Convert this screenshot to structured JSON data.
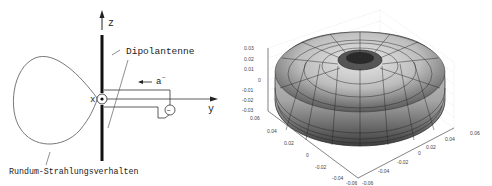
{
  "left_diagram": {
    "axis_z_label": "z",
    "axis_y_label": "y",
    "axis_x_label": "x",
    "antenna_label": "Dipolantenne",
    "current_label": "a",
    "current_superscript": "−",
    "pattern_label": "Rundum-Strahlungsverhalten",
    "source_symbol": "~"
  },
  "right_plot": {
    "type": "3d-surface",
    "shape": "torus radiation pattern",
    "z_ticks": [
      "0.03",
      "0.02",
      "0.01",
      "0",
      "-0.01",
      "-0.02",
      "-0.03"
    ],
    "x_ticks": [
      "0.06",
      "0.04",
      "0.02",
      "0",
      "-0.02",
      "-0.04",
      "-0.06"
    ],
    "y_ticks": [
      "-0.06",
      "-0.04",
      "-0.02",
      "0",
      "0.02",
      "0.04",
      "0.06"
    ]
  }
}
